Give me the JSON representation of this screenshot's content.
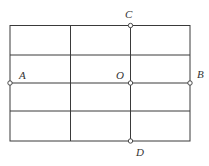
{
  "diagram": {
    "type": "grid-with-points",
    "grid": {
      "x": [
        10,
        70.5,
        130.5,
        190
      ],
      "y": [
        25.5,
        55,
        83,
        111,
        141
      ]
    },
    "points": [
      {
        "id": "A",
        "label": "A",
        "cx": 10,
        "cy": 83,
        "lx": 19,
        "ly": 79
      },
      {
        "id": "O",
        "label": "O",
        "cx": 130.5,
        "cy": 83,
        "lx": 116,
        "ly": 79
      },
      {
        "id": "B",
        "label": "B",
        "cx": 190,
        "cy": 83,
        "lx": 197,
        "ly": 78
      },
      {
        "id": "C",
        "label": "C",
        "cx": 130.5,
        "cy": 25.5,
        "lx": 125,
        "ly": 18
      },
      {
        "id": "D",
        "label": "D",
        "cx": 130.5,
        "cy": 141,
        "lx": 136,
        "ly": 156
      }
    ]
  }
}
